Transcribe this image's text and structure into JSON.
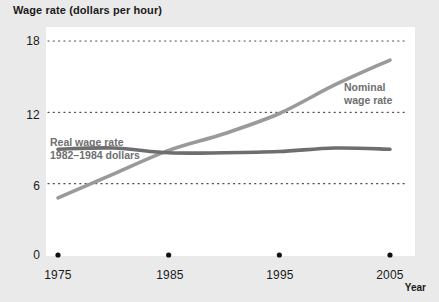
{
  "figure": {
    "title": "Wage rate (dollars per hour)",
    "x_axis_title": "Year",
    "background_color": "#eaeaea",
    "plot_background_color": "#ffffff"
  },
  "axes": {
    "y_ticks": [
      "0",
      "6",
      "12",
      "18"
    ],
    "y_values": [
      0,
      6,
      12,
      18
    ],
    "x_ticks": [
      "1975",
      "1985",
      "1995",
      "2005"
    ],
    "x_values": [
      1975,
      1985,
      1995,
      2005
    ],
    "gridline_style": "dotted",
    "gridline_color": "#4d4d4d"
  },
  "series_labels": {
    "real_line1": "Real wage rate",
    "real_line2": "1982–1984 dollars",
    "nominal_line1": "Nominal",
    "nominal_line2": "wage rate"
  },
  "colors": {
    "nominal": "#9a9a9a",
    "real": "#6e6e6e",
    "text": "#1a1a1a",
    "label_text": "#6f6f6f"
  },
  "chart_data": {
    "type": "line",
    "title": "Wage rate (dollars per hour)",
    "xlabel": "Year",
    "ylabel": "Wage rate (dollars per hour)",
    "xlim": [
      1975,
      2005
    ],
    "ylim": [
      0,
      18
    ],
    "grid": true,
    "legend_position": "inline-annotations",
    "x": [
      1975,
      1980,
      1985,
      1990,
      1995,
      2000,
      2005
    ],
    "series": [
      {
        "name": "Nominal wage rate",
        "color": "#9a9a9a",
        "values": [
          4.8,
          6.8,
          8.8,
          10.2,
          11.9,
          14.3,
          16.4
        ]
      },
      {
        "name": "Real wage rate 1982–1984 dollars",
        "color": "#6e6e6e",
        "values": [
          8.9,
          9.0,
          8.6,
          8.6,
          8.7,
          9.0,
          8.9
        ]
      }
    ]
  }
}
